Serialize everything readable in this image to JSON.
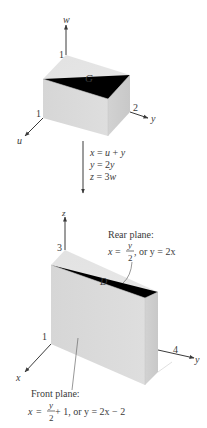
{
  "top_figure": {
    "region_label": "G",
    "axes": {
      "vertical": {
        "name": "w",
        "tick": "1"
      },
      "right": {
        "name": "y",
        "tick": "2"
      },
      "left": {
        "name": "u",
        "tick": "1"
      }
    }
  },
  "transformation": {
    "lines": [
      "x = u + y",
      "y = 2y",
      "z = 3w"
    ],
    "line_parts": [
      {
        "lhs": "x",
        "rhs_a": "u",
        "op": "+",
        "rhs_b": "y"
      },
      {
        "lhs": "y",
        "coef": "2",
        "var": "y"
      },
      {
        "lhs": "z",
        "coef": "3",
        "var": "w"
      }
    ]
  },
  "bottom_figure": {
    "region_label": "D",
    "axes": {
      "vertical": {
        "name": "z",
        "tick": "3"
      },
      "right": {
        "name": "y",
        "tick": "4"
      },
      "left": {
        "name": "x",
        "tick": "1"
      }
    },
    "rear_plane": {
      "title": "Rear plane:",
      "eq_lhs": "x",
      "eq_frac_num": "y",
      "eq_frac_den": "2",
      "eq_tail": ", or y = 2x",
      "text": "x = y/2, or y = 2x"
    },
    "front_plane": {
      "title": "Front plane:",
      "eq_lhs": "x",
      "eq_frac_num": "y",
      "eq_frac_den": "2",
      "eq_tail": " + 1, or y = 2x − 2",
      "text": "x = y/2 + 1, or y = 2x − 2"
    }
  },
  "colors": {
    "face_front": "#d9d9d9",
    "face_top": "#e4e4e4",
    "face_side": "#cfcfcf",
    "ink": "#3a3a3a"
  }
}
